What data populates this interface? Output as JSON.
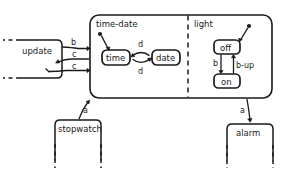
{
  "diagram": {
    "type": "statechart",
    "title": "",
    "composite_state": {
      "name": "",
      "regions": [
        {
          "label": "time-date",
          "states": [
            {
              "name": "time",
              "initial": true
            },
            {
              "name": "date",
              "initial": false
            }
          ],
          "transitions": [
            {
              "from": "time",
              "to": "date",
              "label": "d"
            },
            {
              "from": "date",
              "to": "time",
              "label": "d"
            }
          ]
        },
        {
          "label": "light",
          "states": [
            {
              "name": "off",
              "initial": true
            },
            {
              "name": "on",
              "initial": false
            }
          ],
          "transitions": [
            {
              "from": "off",
              "to": "on",
              "label": "b"
            },
            {
              "from": "on",
              "to": "off",
              "label": "b-up"
            }
          ]
        }
      ]
    },
    "external_states": [
      {
        "name": "update",
        "position": "left",
        "partial": true
      },
      {
        "name": "stopwatch",
        "position": "bottom-left",
        "partial": true
      },
      {
        "name": "alarm",
        "position": "bottom-right",
        "partial": true
      }
    ],
    "external_transitions": [
      {
        "from": "update",
        "to": "time-date",
        "label": "b"
      },
      {
        "from": "time-date",
        "to": "update",
        "label": "c"
      },
      {
        "from": "update",
        "to": "time-date",
        "label": "c"
      },
      {
        "from": "stopwatch",
        "to": "composite",
        "label": "a"
      },
      {
        "from": "composite",
        "to": "alarm",
        "label": "a"
      }
    ],
    "labels": {
      "region_time_date": "time-date",
      "region_light": "light",
      "state_time": "time",
      "state_date": "date",
      "state_off": "off",
      "state_on": "on",
      "state_update": "update",
      "state_stopwatch": "stopwatch",
      "state_alarm": "alarm",
      "t_b": "b",
      "t_c1": "c",
      "t_c2": "c",
      "t_d1": "d",
      "t_d2": "d",
      "t_b_light": "b",
      "t_b_up": "b-up",
      "t_a_left": "a",
      "t_a_right": "a"
    },
    "colors": {
      "stroke": "#1a1a1a",
      "background": "#ffffff"
    }
  }
}
